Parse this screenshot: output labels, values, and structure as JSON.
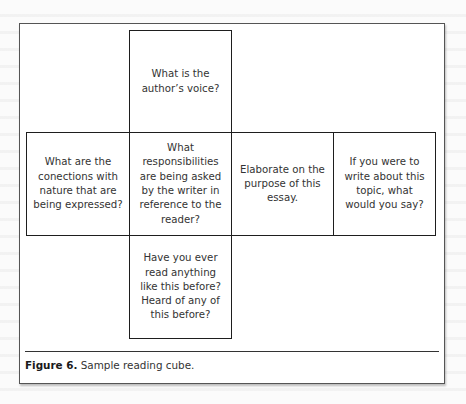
{
  "figure": {
    "label": "Figure 6.",
    "caption": " Sample reading cube."
  },
  "cube": {
    "top": "What is the author’s voice?",
    "left": "What are the conections with nature that are being expressed?",
    "center": "What responsibilities are being asked by the writer in reference to the reader?",
    "right": "Elaborate on the purpose of this essay.",
    "far_right": "If you were to write about this topic, what would you say?",
    "bottom": "Have you ever read anything like this before? Heard of any of this before?"
  },
  "colors": {
    "border": "#1e1e1e",
    "text": "#333333",
    "background": "#ffffff"
  }
}
